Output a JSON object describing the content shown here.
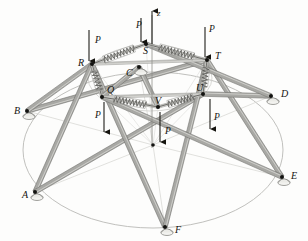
{
  "figure": {
    "background_color": "#fdfdfc",
    "ink_color": "#15140f",
    "strut_fill": "#a8a8a4",
    "strut_edge": "#6d6d69",
    "spring_color": "#5c5c58",
    "ground_circle_color": "#b9b9b5",
    "axis_label": "z",
    "load_label": "P"
  },
  "nodes": {
    "base": [
      {
        "id": "A",
        "label": "A",
        "x": 35,
        "y": 192,
        "label_x": 22,
        "label_y": 198,
        "support": true
      },
      {
        "id": "B",
        "label": "B",
        "x": 27,
        "y": 111,
        "label_x": 14,
        "label_y": 114,
        "support": true
      },
      {
        "id": "C",
        "label": "C",
        "x": 139,
        "y": 67,
        "label_x": 126,
        "label_y": 76,
        "support": true
      },
      {
        "id": "D",
        "label": "D",
        "x": 271,
        "y": 96,
        "label_x": 281,
        "label_y": 97,
        "support": true
      },
      {
        "id": "E",
        "label": "E",
        "x": 282,
        "y": 177,
        "label_x": 291,
        "label_y": 179,
        "support": true
      },
      {
        "id": "F",
        "label": "F",
        "x": 165,
        "y": 227,
        "label_x": 175,
        "label_y": 233,
        "support": true
      }
    ],
    "upper": [
      {
        "id": "Q",
        "label": "Q",
        "x": 102,
        "y": 97,
        "label_x": 107,
        "label_y": 93
      },
      {
        "id": "R",
        "label": "R",
        "x": 92,
        "y": 64,
        "label_x": 78,
        "label_y": 66
      },
      {
        "id": "S",
        "label": "S",
        "x": 146,
        "y": 44,
        "label_x": 143,
        "label_y": 54
      },
      {
        "id": "T",
        "label": "T",
        "x": 207,
        "y": 60,
        "label_x": 215,
        "label_y": 59
      },
      {
        "id": "U",
        "label": "U",
        "x": 203,
        "y": 94,
        "label_x": 196,
        "label_y": 91
      },
      {
        "id": "V",
        "label": "V",
        "x": 158,
        "y": 107,
        "label_x": 155,
        "label_y": 104
      }
    ],
    "center_lower": {
      "id": "O",
      "x": 153,
      "y": 145
    }
  },
  "axis": {
    "label": "z",
    "label_x": 157,
    "label_y": 16,
    "x": 152,
    "y_top": 11,
    "y_bottom": 148
  },
  "loads": [
    {
      "node": "R",
      "label": "P",
      "label_x": 95,
      "label_y": 43,
      "ax": 89,
      "ay_top": 30,
      "ay_bot": 61
    },
    {
      "node": "S",
      "label": "P",
      "label_x": 136,
      "label_y": 28,
      "ax": 141,
      "ay_top": 18,
      "ay_bot": 42
    },
    {
      "node": "T",
      "label": "P",
      "label_x": 209,
      "label_y": 32,
      "ax": 205,
      "ay_top": 27,
      "ay_bot": 57
    },
    {
      "node": "Q",
      "label": "P",
      "label_x": 95,
      "label_y": 118,
      "ax": 104,
      "ay_top": 102,
      "ay_bot": 132
    },
    {
      "node": "V",
      "label": "P",
      "label_x": 165,
      "label_y": 134,
      "ax": 160,
      "ay_top": 112,
      "ay_bot": 142
    },
    {
      "node": "U",
      "label": "P",
      "label_x": 214,
      "label_y": 120,
      "ax": 210,
      "ay_top": 99,
      "ay_bot": 129
    }
  ],
  "springs": [
    {
      "name": "spring-R-S",
      "from": "R",
      "to": "S"
    },
    {
      "name": "spring-S-T",
      "from": "S",
      "to": "T"
    },
    {
      "name": "spring-Q-V",
      "from": "Q",
      "to": "V"
    },
    {
      "name": "spring-V-U",
      "from": "V",
      "to": "U"
    },
    {
      "name": "spring-R-Q",
      "from": "R",
      "to": "Q"
    },
    {
      "name": "spring-T-U",
      "from": "T",
      "to": "U"
    }
  ],
  "struts": [
    {
      "name": "strut-B-T",
      "from": "B",
      "to": "T"
    },
    {
      "name": "strut-B-R",
      "from": "B",
      "to": "R"
    },
    {
      "name": "strut-A-R",
      "from": "A",
      "to": "R"
    },
    {
      "name": "strut-A-U",
      "from": "A",
      "to": "U"
    },
    {
      "name": "strut-F-R",
      "from": "F",
      "to": "R"
    },
    {
      "name": "strut-F-T",
      "from": "F",
      "to": "T"
    },
    {
      "name": "strut-E-T",
      "from": "E",
      "to": "T"
    },
    {
      "name": "strut-E-Q",
      "from": "E",
      "to": "Q"
    },
    {
      "name": "strut-D-U",
      "from": "D",
      "to": "U"
    },
    {
      "name": "strut-D-S",
      "from": "D",
      "to": "S"
    },
    {
      "name": "strut-C-Q",
      "from": "C",
      "to": "Q"
    },
    {
      "name": "strut-C-V",
      "from": "C",
      "to": "V"
    }
  ],
  "ground_ellipse": {
    "cx": 153,
    "cy": 150,
    "rx": 130,
    "ry": 78
  },
  "upper_ellipse": {
    "cx": 150,
    "cy": 78,
    "rx": 62,
    "ry": 33
  }
}
